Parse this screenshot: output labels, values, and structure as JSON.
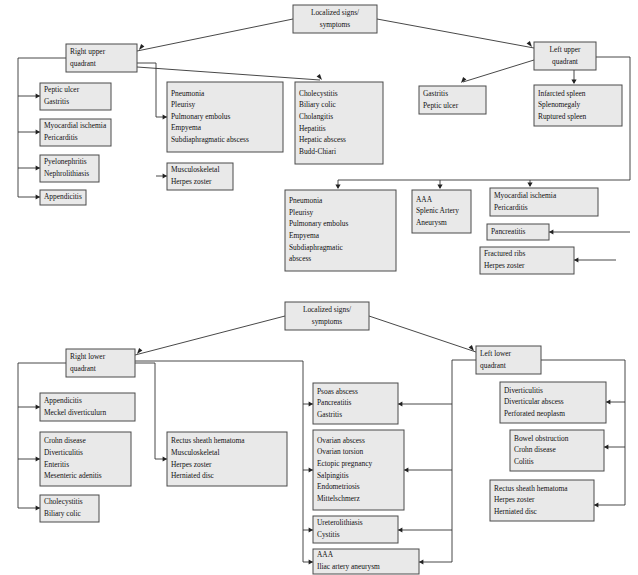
{
  "page": {
    "background_color": "#ffffff",
    "box_fill_color": "#e9e9e9",
    "box_border_color": "#4a4a4a",
    "connector_color": "#333333",
    "text_color": "#111111"
  },
  "chart_data": {
    "type": "diagram",
    "diagrams": [
      {
        "id": "upper",
        "root_label": "Localized signs/ symptoms",
        "branches": [
          "Right upper quadrant",
          "Left upper quadrant"
        ]
      },
      {
        "id": "lower",
        "root_label": "Localized signs/ symptoms",
        "branches": [
          "Right lower quadrant",
          "Left lower quadrant"
        ]
      }
    ]
  },
  "upper_diagram": {
    "root": {
      "name": "upper-root",
      "x": 293,
      "y": 5,
      "w": 84,
      "h": 28,
      "align": "center",
      "lines": [
        "Localized signs/",
        "symptoms"
      ]
    },
    "right_upper_quadrant": {
      "name": "right-upper-quadrant",
      "x": 66,
      "y": 44,
      "w": 71,
      "h": 28,
      "align": "left",
      "lines": [
        "Right upper",
        "quadrant"
      ]
    },
    "left_upper_quadrant": {
      "name": "left-upper-quadrant",
      "x": 534,
      "y": 42,
      "w": 62,
      "h": 28,
      "align": "center",
      "lines": [
        "Left upper",
        "quadrant"
      ]
    },
    "boxes": [
      {
        "name": "box-peptic-ulcer-gastritis",
        "x": 40,
        "y": 83,
        "w": 71,
        "h": 27,
        "align": "left",
        "lines": [
          "Peptic ulcer",
          "Gastritis"
        ]
      },
      {
        "name": "box-myocardial-ischemia-pericarditis",
        "x": 40,
        "y": 119,
        "w": 71,
        "h": 27,
        "align": "left",
        "lines": [
          "Myocardial ischemia",
          "Pericarditis"
        ]
      },
      {
        "name": "box-pyelonephritis-nephrolithiasis",
        "x": 40,
        "y": 155,
        "w": 59,
        "h": 27,
        "align": "left",
        "lines": [
          "Pyelonephritis",
          "Nephrolithiasis"
        ]
      },
      {
        "name": "box-appendicitis-upper",
        "x": 40,
        "y": 190,
        "w": 46,
        "h": 15,
        "align": "left",
        "lines": [
          "Appendicitis"
        ]
      },
      {
        "name": "box-pneumonia-group-upper-left",
        "x": 167,
        "y": 82,
        "w": 116,
        "h": 70,
        "align": "left",
        "lines": [
          "Pneumonia",
          "Pleurisy",
          "Pulmonary embolus",
          "Empyema",
          "Subdiaphragmatic abscess"
        ]
      },
      {
        "name": "box-musculoskeletal-herpes-zoster-upper",
        "x": 167,
        "y": 163,
        "w": 66,
        "h": 27,
        "align": "left",
        "lines": [
          "Musculoskeletal",
          "Herpes zoster"
        ]
      },
      {
        "name": "box-cholecystitis-group",
        "x": 295,
        "y": 82,
        "w": 88,
        "h": 82,
        "align": "left",
        "lines": [
          "Cholecystitis",
          "Biliary colic",
          "Cholangitis",
          "Hepatitis",
          "Hepatic abscess",
          "Budd-Chiari"
        ]
      },
      {
        "name": "box-gastritis-peptic-ulcer",
        "x": 419,
        "y": 86,
        "w": 67,
        "h": 28,
        "align": "left",
        "lines": [
          "Gastritis",
          "Peptic ulcer"
        ]
      },
      {
        "name": "box-spleen-group",
        "x": 534,
        "y": 85,
        "w": 88,
        "h": 41,
        "align": "left",
        "lines": [
          "Infarcted spleen",
          "Splenomegaly",
          "Ruptured spleen"
        ]
      },
      {
        "name": "box-pneumonia-group-upper-right",
        "x": 285,
        "y": 190,
        "w": 111,
        "h": 81,
        "align": "left",
        "lines": [
          "Pneumonia",
          "Pleurisy",
          "Pulmonary embolus",
          "Empyema",
          "Subdiaphragmatic",
          "abscess"
        ]
      },
      {
        "name": "box-aaa-splenic-artery",
        "x": 412,
        "y": 190,
        "w": 59,
        "h": 43,
        "align": "left",
        "lines": [
          "AAA",
          "Splenic Artery",
          "Aneurysm"
        ]
      },
      {
        "name": "box-myocardial-ischemia-pericarditis-right",
        "x": 490,
        "y": 188,
        "w": 108,
        "h": 28,
        "align": "left",
        "lines": [
          "Myocardial ischemia",
          "Pericarditis"
        ]
      },
      {
        "name": "box-pancreatitis",
        "x": 487,
        "y": 224,
        "w": 62,
        "h": 16,
        "align": "left",
        "lines": [
          "Pancreatitis"
        ]
      },
      {
        "name": "box-fractured-ribs-herpes-zoster",
        "x": 480,
        "y": 247,
        "w": 94,
        "h": 27,
        "align": "left",
        "lines": [
          "Fractured ribs",
          "Herpes zoster"
        ]
      }
    ],
    "connectors": [
      {
        "name": "conn-root-to-ruq",
        "path": "M 293 19 L 137 51",
        "arrow": {
          "x": 139,
          "y": 50,
          "dir": "left-down"
        }
      },
      {
        "name": "conn-root-to-luq",
        "path": "M 377 19 L 534 48",
        "arrow": {
          "x": 532,
          "y": 47,
          "dir": "right-down"
        }
      },
      {
        "name": "conn-ruq-trunk-left",
        "path": "M 66 58 L 18 58 L 18 197 L 40 197",
        "arrow": {
          "x": 40,
          "y": 197,
          "dir": "right"
        }
      },
      {
        "name": "conn-trunk-to-peptic",
        "path": "M 18 96 L 40 96",
        "arrow": {
          "x": 40,
          "y": 96,
          "dir": "right"
        }
      },
      {
        "name": "conn-trunk-to-myocardial",
        "path": "M 18 132 L 40 132",
        "arrow": {
          "x": 40,
          "y": 132,
          "dir": "right"
        }
      },
      {
        "name": "conn-trunk-to-pyelo",
        "path": "M 18 168 L 40 168",
        "arrow": {
          "x": 40,
          "y": 168,
          "dir": "right"
        }
      },
      {
        "name": "conn-ruq-to-mid",
        "path": "M 137 63 L 156 63 L 156 117 L 167 117",
        "arrow": {
          "x": 167,
          "y": 117,
          "dir": "right"
        }
      },
      {
        "name": "conn-mid-to-musculoskeletal",
        "path": "M 156 176 L 167 176",
        "arrow": {
          "x": 167,
          "y": 176,
          "dir": "right"
        }
      },
      {
        "name": "conn-ruq-to-cholecystitis",
        "path": "M 137 67 L 320 80",
        "arrow": {
          "x": 322,
          "y": 80,
          "dir": "right-down"
        }
      },
      {
        "name": "conn-luq-to-gastritis",
        "path": "M 534 60 L 463 82",
        "arrow": {
          "x": 461,
          "y": 83,
          "dir": "left-down"
        }
      },
      {
        "name": "conn-luq-to-spleen",
        "path": "M 574 70 L 574 83",
        "arrow": {
          "x": 574,
          "y": 84,
          "dir": "down"
        }
      },
      {
        "name": "conn-luq-right-trunk",
        "path": "M 596 57 L 630 57 L 630 180 L 338 180 L 338 188",
        "arrow": {
          "x": 338,
          "y": 189,
          "dir": "down"
        }
      },
      {
        "name": "conn-trunk-to-aaa",
        "path": "M 440 180 L 440 188",
        "arrow": {
          "x": 440,
          "y": 189,
          "dir": "down"
        }
      },
      {
        "name": "conn-trunk-to-myo-right",
        "path": "M 530 180 L 530 186",
        "arrow": {
          "x": 530,
          "y": 187,
          "dir": "down"
        }
      },
      {
        "name": "conn-right-to-pancreatitis",
        "path": "M 630 232 L 549 232",
        "arrow": {
          "x": 549,
          "y": 232,
          "dir": "left"
        }
      },
      {
        "name": "conn-right-to-fractured",
        "path": "M 616 260 L 574 260",
        "arrow": {
          "x": 574,
          "y": 260,
          "dir": "left"
        }
      }
    ]
  },
  "lower_diagram": {
    "root": {
      "name": "lower-root",
      "x": 285,
      "y": 302,
      "w": 84,
      "h": 28,
      "align": "center",
      "lines": [
        "Localized signs/",
        "symptoms"
      ]
    },
    "right_lower_quadrant": {
      "name": "right-lower-quadrant",
      "x": 66,
      "y": 349,
      "w": 69,
      "h": 28,
      "align": "left",
      "lines": [
        "Right lower",
        "quadrant"
      ]
    },
    "left_lower_quadrant": {
      "name": "left-lower-quadrant",
      "x": 476,
      "y": 346,
      "w": 65,
      "h": 28,
      "align": "left",
      "lines": [
        "Left lower",
        "quadrant"
      ]
    },
    "boxes": [
      {
        "name": "box-appendicitis-meckel",
        "x": 40,
        "y": 393,
        "w": 95,
        "h": 28,
        "align": "left",
        "lines": [
          "Appendicitis",
          "Meckel diverticulurn"
        ]
      },
      {
        "name": "box-crohn-group",
        "x": 40,
        "y": 432,
        "w": 91,
        "h": 54,
        "align": "left",
        "lines": [
          "Crohn disease",
          "Diverticulitis",
          "Enteritis",
          "Mesenteric adenitis"
        ]
      },
      {
        "name": "box-cholecystitis-biliary-lower",
        "x": 40,
        "y": 495,
        "w": 59,
        "h": 27,
        "align": "left",
        "lines": [
          "Cholecystitis",
          "Biliary colic"
        ]
      },
      {
        "name": "box-rectus-sheath-left",
        "x": 167,
        "y": 432,
        "w": 120,
        "h": 54,
        "align": "left",
        "lines": [
          "Rectus sheath hematoma",
          "Musculoskeletal",
          "Herpes zoster",
          "Herniated disc"
        ]
      },
      {
        "name": "box-psoas-abscess",
        "x": 313,
        "y": 383,
        "w": 85,
        "h": 41,
        "align": "left",
        "lines": [
          "Psoas abscess",
          "Pancreatitis",
          "Gastritis"
        ]
      },
      {
        "name": "box-ovarian-group",
        "x": 313,
        "y": 430,
        "w": 91,
        "h": 80,
        "align": "left",
        "lines": [
          "Ovarian abscess",
          "Ovarian torsion",
          "Ectopic pregnancy",
          "Salpingitis",
          "Endometriosis",
          "Mittelschmerz"
        ]
      },
      {
        "name": "box-ureterolithiasis-cystitis",
        "x": 313,
        "y": 516,
        "w": 85,
        "h": 27,
        "align": "left",
        "lines": [
          "Ureterolithiasis",
          "Cystitis"
        ]
      },
      {
        "name": "box-aaa-iliac",
        "x": 313,
        "y": 549,
        "w": 106,
        "h": 25,
        "align": "left",
        "lines": [
          "AAA",
          "Iliac artery aneurysm"
        ]
      },
      {
        "name": "box-diverticulitis-group",
        "x": 500,
        "y": 382,
        "w": 106,
        "h": 41,
        "align": "left",
        "lines": [
          "Diverticulitis",
          "Diverticular abscess",
          "Perforated neoplasm"
        ]
      },
      {
        "name": "box-bowel-obstruction",
        "x": 510,
        "y": 430,
        "w": 94,
        "h": 41,
        "align": "left",
        "lines": [
          "Bowel obstruction",
          "Crohn disease",
          "Colitis"
        ]
      },
      {
        "name": "box-rectus-sheath-right",
        "x": 490,
        "y": 480,
        "w": 104,
        "h": 41,
        "align": "left",
        "lines": [
          "Rectus sheath hematoma",
          "Herpes zoster",
          "Herniated disc"
        ]
      }
    ],
    "connectors": [
      {
        "name": "conn-lower-root-to-rlq",
        "path": "M 285 316 L 135 355",
        "arrow": {
          "x": 137,
          "y": 354,
          "dir": "left-down"
        }
      },
      {
        "name": "conn-lower-root-to-llq",
        "path": "M 369 316 L 476 352",
        "arrow": {
          "x": 474,
          "y": 351,
          "dir": "right-down"
        }
      },
      {
        "name": "conn-rlq-trunk-left",
        "path": "M 66 363 L 18 363 L 18 508 L 40 508",
        "arrow": {
          "x": 40,
          "y": 508,
          "dir": "right"
        }
      },
      {
        "name": "conn-rlq-trunk-to-appendicitis",
        "path": "M 18 407 L 40 407",
        "arrow": {
          "x": 40,
          "y": 407,
          "dir": "right"
        }
      },
      {
        "name": "conn-rlq-trunk-to-crohn",
        "path": "M 18 459 L 40 459",
        "arrow": {
          "x": 40,
          "y": 459,
          "dir": "right"
        }
      },
      {
        "name": "conn-rlq-to-mid-trunk",
        "path": "M 135 363 L 155 363 L 155 459 L 167 459",
        "arrow": {
          "x": 167,
          "y": 459,
          "dir": "right"
        }
      },
      {
        "name": "conn-rlq-center-trunk",
        "path": "M 135 361 L 303 361 L 303 562 L 313 562",
        "arrow": {
          "x": 313,
          "y": 562,
          "dir": "right"
        }
      },
      {
        "name": "conn-center-to-psoas",
        "path": "M 303 404 L 313 404",
        "arrow": {
          "x": 313,
          "y": 404,
          "dir": "right"
        }
      },
      {
        "name": "conn-center-to-ovarian",
        "path": "M 303 470 L 313 470",
        "arrow": {
          "x": 313,
          "y": 470,
          "dir": "right"
        }
      },
      {
        "name": "conn-center-to-uretero",
        "path": "M 303 530 L 313 530",
        "arrow": {
          "x": 313,
          "y": 530,
          "dir": "right"
        }
      },
      {
        "name": "conn-llq-left-trunk",
        "path": "M 476 360 L 452 360 L 452 562 L 419 562",
        "arrow": {
          "x": 419,
          "y": 562,
          "dir": "left"
        }
      },
      {
        "name": "conn-llq-left-to-psoas",
        "path": "M 452 404 L 398 404",
        "arrow": {
          "x": 398,
          "y": 404,
          "dir": "left"
        }
      },
      {
        "name": "conn-llq-left-to-ovarian",
        "path": "M 452 470 L 404 470",
        "arrow": {
          "x": 404,
          "y": 470,
          "dir": "left"
        }
      },
      {
        "name": "conn-llq-left-to-uretero",
        "path": "M 452 530 L 398 530",
        "arrow": {
          "x": 398,
          "y": 530,
          "dir": "left"
        }
      },
      {
        "name": "conn-llq-right-trunk",
        "path": "M 541 360 L 625 360 L 625 505 L 594 505",
        "arrow": {
          "x": 594,
          "y": 505,
          "dir": "left"
        }
      },
      {
        "name": "conn-llq-right-to-diverticulitis",
        "path": "M 625 402 L 606 402",
        "arrow": {
          "x": 606,
          "y": 402,
          "dir": "left"
        }
      },
      {
        "name": "conn-llq-right-to-bowel",
        "path": "M 625 447 L 604 447",
        "arrow": {
          "x": 604,
          "y": 447,
          "dir": "left"
        }
      }
    ]
  }
}
